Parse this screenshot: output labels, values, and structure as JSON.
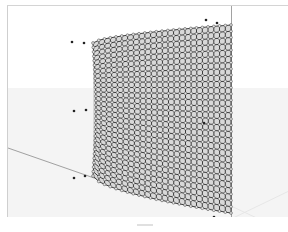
{
  "viewport": {
    "type": "3D perspective viewport",
    "surface": {
      "kind": "curved NURBS surface",
      "display": "control point grid",
      "grid_rows": 30,
      "grid_cols": 24,
      "line_color": "#2a2a2a",
      "fill_color": "#d8d8d8"
    },
    "colors": {
      "background_upper": "#ffffff",
      "background_lower": "#f4f4f4",
      "axis_line": "#8a8a8a",
      "horizon_line": "#e6e6e6"
    },
    "points": [
      {
        "x": 71,
        "y": 41
      },
      {
        "x": 83,
        "y": 42
      },
      {
        "x": 73,
        "y": 110
      },
      {
        "x": 85,
        "y": 109
      },
      {
        "x": 73,
        "y": 177
      },
      {
        "x": 84,
        "y": 175
      },
      {
        "x": 205,
        "y": 19
      },
      {
        "x": 216,
        "y": 22
      },
      {
        "x": 203,
        "y": 122
      },
      {
        "x": 200,
        "y": 221
      },
      {
        "x": 213,
        "y": 216
      }
    ]
  }
}
